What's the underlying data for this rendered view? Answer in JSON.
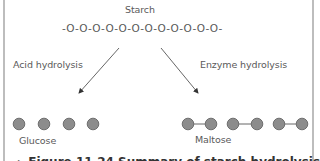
{
  "diagram": {
    "title": "Starch",
    "chain": "-O-O-O-O-O-O-O-O-O-O-O-O-",
    "left_branch": {
      "label": "Acid hydrolysis",
      "product": "Glucose",
      "units": 4,
      "linked": false
    },
    "right_branch": {
      "label": "Enzyme hydrolysis",
      "product": "Maltose",
      "pairs": 3,
      "linked": true
    },
    "caption": "▸ Figure 11.24 Summary of starch hydrolysis",
    "colors": {
      "circle_fill": "#8c8c8c",
      "circle_stroke": "#6e6e6e",
      "line": "#555555",
      "border": "#bdbdbd"
    }
  }
}
